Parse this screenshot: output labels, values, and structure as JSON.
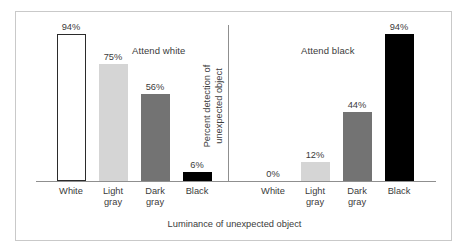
{
  "chart_data": {
    "type": "bar",
    "title": "",
    "xlabel": "Luminance of unexpected object",
    "ylabel": "Percent detection of unexpected object",
    "ylabel_line1": "Percent detection of",
    "ylabel_line2": "unexpected object",
    "ylim": [
      0,
      100
    ],
    "grid": false,
    "legend": "none",
    "panels": [
      {
        "name": "attend-white",
        "title": "Attend white",
        "categories": [
          "White",
          "Light gray",
          "Dark gray",
          "Black"
        ],
        "values": [
          94,
          75,
          56,
          6
        ],
        "labels": [
          "94%",
          "75%",
          "56%",
          "6%"
        ],
        "colors": [
          "#ffffff",
          "#d5d5d5",
          "#737373",
          "#000000"
        ],
        "styles": [
          "white",
          "light",
          "dark",
          "black"
        ],
        "tick_lines": [
          {
            "l1": "White",
            "l2": ""
          },
          {
            "l1": "Light",
            "l2": "gray"
          },
          {
            "l1": "Dark",
            "l2": "gray"
          },
          {
            "l1": "Black",
            "l2": ""
          }
        ]
      },
      {
        "name": "attend-black",
        "title": "Attend black",
        "categories": [
          "White",
          "Light gray",
          "Dark gray",
          "Black"
        ],
        "values": [
          0,
          12,
          44,
          94
        ],
        "labels": [
          "0%",
          "12%",
          "44%",
          "94%"
        ],
        "colors": [
          "#ffffff",
          "#d5d5d5",
          "#737373",
          "#000000"
        ],
        "styles": [
          "white",
          "light",
          "dark",
          "black"
        ],
        "tick_lines": [
          {
            "l1": "White",
            "l2": ""
          },
          {
            "l1": "Light",
            "l2": "gray"
          },
          {
            "l1": "Dark",
            "l2": "gray"
          },
          {
            "l1": "Black",
            "l2": ""
          }
        ]
      }
    ],
    "colors": {
      "white_bar": "#ffffff",
      "light_gray_bar": "#d5d5d5",
      "dark_gray_bar": "#737373",
      "black_bar": "#000000",
      "axis_line": "#8f8f8f",
      "frame": "#c9c9c9",
      "text": "#3b3b3b"
    }
  }
}
